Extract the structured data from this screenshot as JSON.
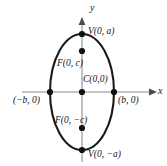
{
  "figure": {
    "type": "ellipse-diagram",
    "colors": {
      "curve": "#1a1a1a",
      "axis": "#8c8c8c",
      "point": "#111111",
      "text": "#141414",
      "background": "#ffffff"
    },
    "axes": {
      "x_label": "x",
      "y_label": "y",
      "x_axis": {
        "x1": 22,
        "x2": 157,
        "y": 92
      },
      "y_axis": {
        "y1": 18,
        "y2": 162,
        "x": 82
      }
    },
    "ellipse": {
      "center_x": 82,
      "center_y": 92,
      "semi_axis_x": 32,
      "semi_axis_y": 58,
      "stroke_width": 2.1
    },
    "points": [
      {
        "name": "vertex-top",
        "label": "V(0, a)",
        "cx": 82,
        "cy": 34,
        "lx": 88,
        "ly": 27
      },
      {
        "name": "focus-top",
        "label": "F(0, c)",
        "cx": 82,
        "cy": 51,
        "lx": 57,
        "ly": 59
      },
      {
        "name": "center",
        "label": "C(0,0)",
        "cx": 82,
        "cy": 92,
        "lx": 83,
        "ly": 75
      },
      {
        "name": "focus-bottom",
        "label": "F(0, −c)",
        "cx": 82,
        "cy": 128,
        "lx": 55,
        "ly": 116
      },
      {
        "name": "vertex-bottom",
        "label": "V(0, −a)",
        "cx": 82,
        "cy": 150,
        "lx": 88,
        "ly": 150
      },
      {
        "name": "covertex-left",
        "label": "(−b, 0)",
        "cx": 50,
        "cy": 92,
        "lx": 14,
        "ly": 96
      },
      {
        "name": "covertex-right",
        "label": "(b, 0)",
        "cx": 114,
        "cy": 92,
        "lx": 118,
        "ly": 96
      }
    ],
    "point_radius": 3.1
  }
}
